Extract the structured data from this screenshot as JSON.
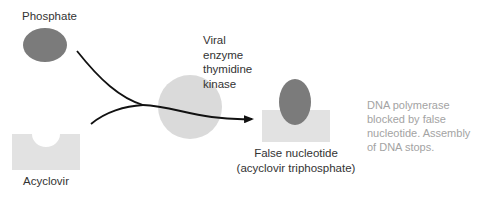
{
  "labels": {
    "phosphate": "Phosphate",
    "acyclovir": "Acyclovir",
    "enzyme_lines": [
      "Viral",
      "enzyme",
      "thymidine",
      "kinase"
    ],
    "false_nucleotide_lines": [
      "False nucleotide",
      "(acyclovir triphosphate)"
    ],
    "dna_note_lines": [
      "DNA polymerase",
      "blocked by false",
      "nucleotide. Assembly",
      "of DNA stops."
    ]
  },
  "colors": {
    "phosphate": "#7b7b7b",
    "enzyme": "#dadada",
    "acyclovir_block": "#e2e2e2",
    "arrow": "#111111",
    "note_text": "#a3a3a3"
  }
}
